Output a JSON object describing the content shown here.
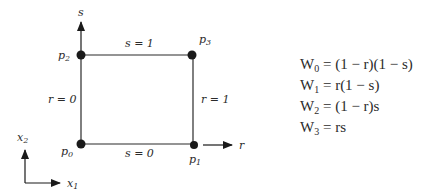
{
  "diagram": {
    "colors": {
      "ink": "#2b2b2b",
      "background": "#ffffff"
    },
    "axes": {
      "param_horizontal": "r",
      "param_vertical": "s",
      "global_horizontal": {
        "base": "x",
        "sub": "1"
      },
      "global_vertical": {
        "base": "x",
        "sub": "2"
      }
    },
    "nodes": [
      {
        "id": "p0",
        "base": "p",
        "sub": "0"
      },
      {
        "id": "p1",
        "base": "p",
        "sub": "1"
      },
      {
        "id": "p2",
        "base": "p",
        "sub": "2"
      },
      {
        "id": "p3",
        "base": "p",
        "sub": "3"
      }
    ],
    "edges": {
      "bottom": "s = 0",
      "top": "s = 1",
      "left": "r = 0",
      "right": "r = 1"
    }
  },
  "equations": [
    {
      "lhs": "W",
      "sub": "0",
      "rhs": "= (1 − r)(1 − s)"
    },
    {
      "lhs": "W",
      "sub": "1",
      "rhs": "= r(1 − s)"
    },
    {
      "lhs": "W",
      "sub": "2",
      "rhs": "= (1 − r)s"
    },
    {
      "lhs": "W",
      "sub": "3",
      "rhs": "= rs"
    }
  ]
}
